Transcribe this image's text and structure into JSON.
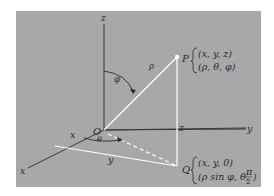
{
  "diagram": {
    "colors": {
      "panel": "#a8a8a8",
      "axis": "#3a3a3a",
      "highlight": "#ffffff",
      "text": "#2a2a2a"
    },
    "axes": {
      "x_label": "x",
      "y_label": "y",
      "z_label": "z"
    },
    "origin_label": "O",
    "point_p": {
      "label": "P",
      "cartesian": "(x, y, z)",
      "spherical": "(ρ, θ, φ)"
    },
    "point_q": {
      "label": "Q",
      "cartesian": "(x, y, 0)",
      "spherical_prefix": "(ρ sin φ, θ, ",
      "spherical_frac_num": "π",
      "spherical_frac_den": "2",
      "spherical_suffix": ")"
    },
    "segment_labels": {
      "rho": "ρ",
      "phi": "φ",
      "theta": "θ",
      "x_dist": "x",
      "y_dist": "y",
      "z_dist": "z"
    }
  }
}
